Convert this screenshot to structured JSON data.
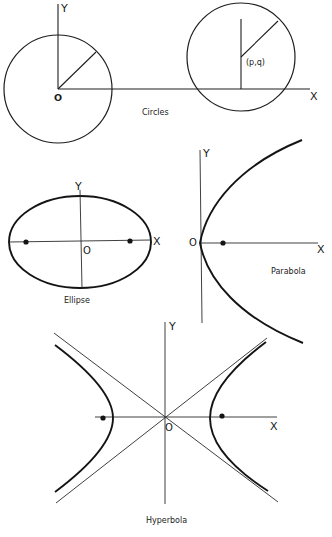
{
  "figure": {
    "circles": {
      "caption": "Circles",
      "y_label": "Y",
      "x_label": "X",
      "origin_label": "O",
      "center_label": "(p,q)"
    },
    "ellipse": {
      "caption": "Ellipse",
      "y_label": "Y",
      "x_label": "X",
      "origin_label": "O"
    },
    "parabola": {
      "caption": "Parabola",
      "y_label": "Y",
      "x_label": "X",
      "origin_label": "O"
    },
    "hyperbola": {
      "caption": "Hyperbola",
      "y_label": "Y",
      "x_label": "X",
      "origin_label": "O"
    }
  }
}
